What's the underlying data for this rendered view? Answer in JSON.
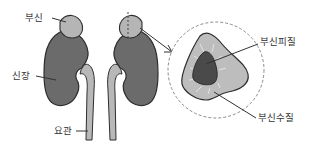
{
  "diagram": {
    "labels": {
      "adrenal_gland": "부신",
      "kidney": "신장",
      "ureter": "요관",
      "adrenal_cortex": "부신피질",
      "adrenal_medulla": "부신수질"
    },
    "colors": {
      "kidney": "#6b6b6b",
      "adrenal": "#b5b5b5",
      "ureter": "#b8b8b8",
      "outline": "#2e2e2e",
      "cortex": "#bdbdbd",
      "medulla": "#4a4a4a",
      "dashed_circle": "#8a8a8a"
    }
  }
}
